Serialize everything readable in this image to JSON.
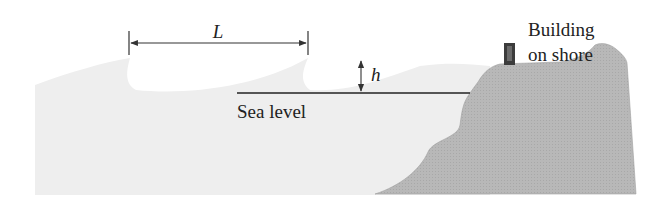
{
  "figure": {
    "type": "tsunami-wave-diagram",
    "labels": {
      "wavelength": "L",
      "wave_height": "h",
      "sea_level": "Sea level",
      "building_line1": "Building",
      "building_line2": "on shore"
    }
  },
  "colors": {
    "sea": "#eeeeee",
    "land": "#b5b5b5",
    "land_edge": "#9a9a9a",
    "building": "#3c3c3c",
    "line": "#222222",
    "text": "#222222"
  }
}
